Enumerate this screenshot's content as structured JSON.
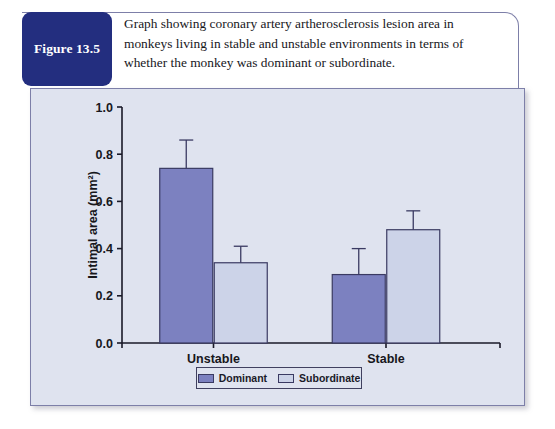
{
  "figure": {
    "label": "Figure 13.5",
    "caption": "Graph showing coronary artery artherosclerosis lesion area in monkeys living in stable and unstable environments in terms of whether the monkey was dominant or subordinate."
  },
  "colors": {
    "label_box": "#232e7f",
    "panel_background": "#dfe3ef",
    "panel_border": "#7d7fa8",
    "dominant_fill": "#7c81c0",
    "subordinate_fill": "#ccd3e8",
    "bar_outline": "#3a3a62",
    "axis": "#1a1a28",
    "text": "#17171c"
  },
  "chart_data": {
    "type": "bar",
    "title": "",
    "xlabel": "",
    "ylabel": "Intimal area (mm²)",
    "categories": [
      "Unstable",
      "Stable"
    ],
    "ylim": [
      0.0,
      1.0
    ],
    "yticks": [
      "0.0",
      "0.2",
      "0.4",
      "0.6",
      "0.8",
      "1.0"
    ],
    "ytick_values": [
      0.0,
      0.2,
      0.4,
      0.6,
      0.8,
      1.0
    ],
    "grid": false,
    "legend_position": "bottom-center",
    "series": [
      {
        "name": "Dominant",
        "color": "#7c81c0",
        "values": [
          0.74,
          0.29
        ],
        "errors_upper": [
          0.86,
          0.4
        ]
      },
      {
        "name": "Subordinate",
        "color": "#ccd3e8",
        "values": [
          0.34,
          0.48
        ],
        "errors_upper": [
          0.41,
          0.56
        ]
      }
    ]
  }
}
